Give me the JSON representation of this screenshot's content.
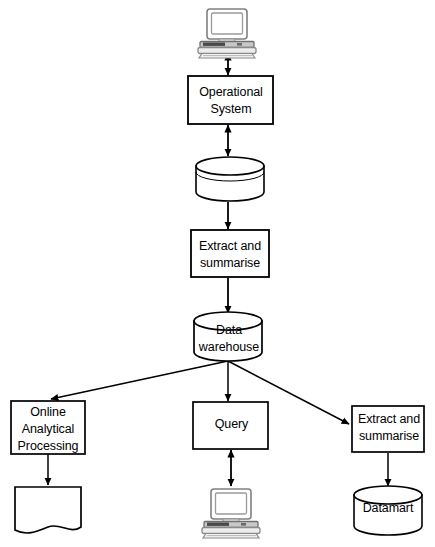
{
  "diagram": {
    "stroke_color": "#000000",
    "fill_color": "#ffffff",
    "icon_shade": "#d9d9d9",
    "nodes": [
      {
        "id": "top_terminal",
        "name": "computer-icon-top",
        "shape": "computer",
        "label": ""
      },
      {
        "id": "operational_system",
        "name": "operational-system-box",
        "shape": "rectangle",
        "label": "Operational\nSystem"
      },
      {
        "id": "operational_db",
        "name": "operational-database-cylinder",
        "shape": "cylinder",
        "label": ""
      },
      {
        "id": "extract_summarise_1",
        "name": "extract-and-summarise-box-top",
        "shape": "rectangle",
        "label": "Extract and\nsummarise"
      },
      {
        "id": "data_warehouse",
        "name": "data-warehouse-cylinder",
        "shape": "cylinder",
        "label": "Data\nwarehouse"
      },
      {
        "id": "olap",
        "name": "online-analytical-processing-box",
        "shape": "rectangle",
        "label": "Online\nAnalytical\nProcessing"
      },
      {
        "id": "query",
        "name": "query-box",
        "shape": "rectangle",
        "label": "Query"
      },
      {
        "id": "extract_summarise_2",
        "name": "extract-and-summarise-box-bottom",
        "shape": "rectangle",
        "label": "Extract and\nsummarise"
      },
      {
        "id": "report_document",
        "name": "report-document-shape",
        "shape": "document",
        "label": ""
      },
      {
        "id": "bottom_terminal",
        "name": "computer-icon-bottom",
        "shape": "computer",
        "label": ""
      },
      {
        "id": "datamart",
        "name": "datamart-cylinder",
        "shape": "cylinder",
        "label": "Datamart"
      }
    ],
    "edges": [
      {
        "from": "top_terminal",
        "to": "operational_system",
        "style": "double-arrow"
      },
      {
        "from": "operational_system",
        "to": "operational_db",
        "style": "double-arrow"
      },
      {
        "from": "operational_db",
        "to": "extract_summarise_1",
        "style": "arrow"
      },
      {
        "from": "extract_summarise_1",
        "to": "data_warehouse",
        "style": "arrow"
      },
      {
        "from": "data_warehouse",
        "to": "olap",
        "style": "arrow"
      },
      {
        "from": "data_warehouse",
        "to": "query",
        "style": "arrow"
      },
      {
        "from": "data_warehouse",
        "to": "extract_summarise_2",
        "style": "arrow"
      },
      {
        "from": "olap",
        "to": "report_document",
        "style": "arrow"
      },
      {
        "from": "query",
        "to": "bottom_terminal",
        "style": "double-arrow"
      },
      {
        "from": "extract_summarise_2",
        "to": "datamart",
        "style": "arrow"
      }
    ]
  }
}
